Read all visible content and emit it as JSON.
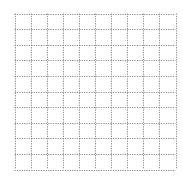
{
  "grid": {
    "columns": 10,
    "rows": 10,
    "line_color": "#8a8a8a",
    "line_style": "dotted",
    "background": "#ffffff"
  }
}
